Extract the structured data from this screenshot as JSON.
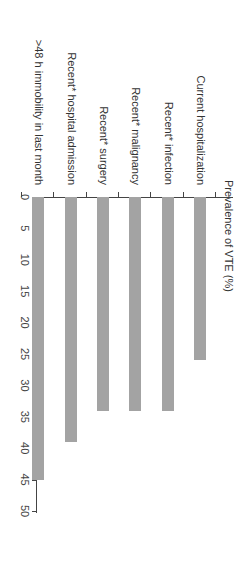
{
  "chart_data": {
    "type": "bar",
    "orientation": "vertical (image rotated 90 degrees clockwise)",
    "title": "",
    "xlabel": "",
    "ylabel": "Prevalence of VTE (%)",
    "ylim": [
      0,
      50
    ],
    "yticks": [
      0,
      5,
      10,
      15,
      20,
      25,
      30,
      35,
      40,
      45,
      50
    ],
    "grid": false,
    "legend": null,
    "categories": [
      ">48 h immobility in last month",
      "Recent* hospital admission",
      "Recent* surgery",
      "Recent* malignancy",
      "Recent* infection",
      "Current hospitalization"
    ],
    "values": [
      45,
      39,
      34,
      34,
      34,
      26
    ],
    "bar_color": "#a3a3a3"
  },
  "labels": {
    "ylabel": "Prevalence of VTE (%)",
    "ticks": [
      "0",
      "5",
      "10",
      "15",
      "20",
      "25",
      "30",
      "35",
      "40",
      "45",
      "50"
    ],
    "categories": [
      ">48 h immobility in last month",
      "Recent* hospital admission",
      "Recent* surgery",
      "Recent* malignancy",
      "Recent* infection",
      "Current hospitalization"
    ]
  }
}
